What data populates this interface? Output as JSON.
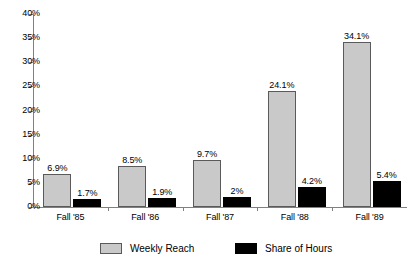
{
  "chart_data": {
    "type": "bar",
    "title": "",
    "xlabel": "",
    "ylabel": "",
    "categories": [
      "Fall '85",
      "Fall '86",
      "Fall '87",
      "Fall '88",
      "Fall '89"
    ],
    "series": [
      {
        "name": "Weekly Reach",
        "color": "#c9c9c9",
        "values": [
          6.9,
          8.5,
          9.7,
          24.1,
          34.1
        ],
        "labels": [
          "6.9%",
          "8.5%",
          "9.7%",
          "24.1%",
          "34.1%"
        ]
      },
      {
        "name": "Share of Hours",
        "color": "#000000",
        "values": [
          1.7,
          1.9,
          2.0,
          4.2,
          5.4
        ],
        "labels": [
          "1.7%",
          "1.9%",
          "2%",
          "4.2%",
          "5.4%"
        ]
      }
    ],
    "ylim": [
      0,
      40
    ],
    "ytick_values": [
      0,
      5,
      10,
      15,
      20,
      25,
      30,
      35,
      40
    ],
    "ytick_labels": [
      "0%",
      "5%",
      "10%",
      "15%",
      "20%",
      "25%",
      "30%",
      "35%",
      "40%"
    ],
    "grid": false,
    "legend_position": "bottom"
  },
  "legend": {
    "items": [
      {
        "label": "Weekly Reach",
        "swatch": "gray-swatch"
      },
      {
        "label": "Share of Hours",
        "swatch": "black-swatch"
      }
    ]
  }
}
